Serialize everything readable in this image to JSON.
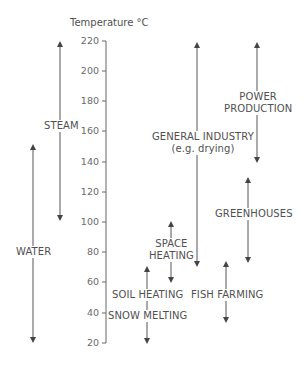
{
  "axis": {
    "title": "Temperature °C",
    "ticks": [
      "220",
      "200",
      "180",
      "160",
      "140",
      "120",
      "100",
      "80",
      "60",
      "40",
      "20"
    ]
  },
  "ranges": {
    "steam": {
      "label": "STEAM",
      "from": 100,
      "to": 220
    },
    "water": {
      "label": "WATER",
      "from": 20,
      "to": 150
    },
    "power": {
      "label_line1": "POWER",
      "label_line2": "PRODUCTION",
      "from": 140,
      "to": 220
    },
    "industry": {
      "label_line1": "GENERAL INDUSTRY",
      "label_line2": "(e.g. drying)",
      "from": 70,
      "to": 220
    },
    "greenhouses": {
      "label": "GREENHOUSES",
      "from": 75,
      "to": 130
    },
    "space_heating": {
      "label_line1": "SPACE",
      "label_line2": "HEATING",
      "from": 60,
      "to": 100
    },
    "soil_heating": {
      "label": "SOIL HEATING",
      "from": 20,
      "to": 70
    },
    "snow_melting": {
      "label": "SNOW MELTING"
    },
    "fish_farming": {
      "label": "FISH FARMING",
      "from": 35,
      "to": 75
    }
  },
  "colors": {
    "line": "#555555",
    "text": "#505050"
  }
}
